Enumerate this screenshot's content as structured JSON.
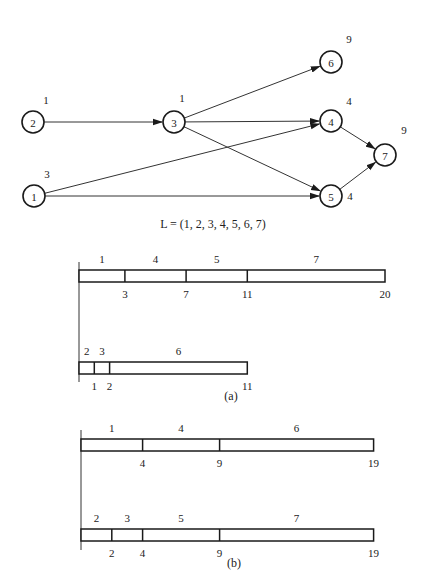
{
  "graph": {
    "nodes": [
      {
        "id": "1",
        "label": "1",
        "weight": "3",
        "x": 34,
        "y": 196,
        "wx": 47,
        "wy": 174
      },
      {
        "id": "2",
        "label": "2",
        "weight": "1",
        "x": 33,
        "y": 122,
        "wx": 46,
        "wy": 100
      },
      {
        "id": "3",
        "label": "3",
        "weight": "1",
        "x": 174,
        "y": 122,
        "wx": 182,
        "wy": 98
      },
      {
        "id": "4",
        "label": "4",
        "weight": "4",
        "x": 331,
        "y": 121,
        "wx": 349,
        "wy": 101
      },
      {
        "id": "5",
        "label": "5",
        "weight": "4",
        "x": 331,
        "y": 196,
        "wx": 350,
        "wy": 196
      },
      {
        "id": "6",
        "label": "6",
        "weight": "9",
        "x": 331,
        "y": 62,
        "wx": 349,
        "wy": 39
      },
      {
        "id": "7",
        "label": "7",
        "weight": "9",
        "x": 385,
        "y": 155,
        "wx": 404,
        "wy": 130
      }
    ],
    "edges": [
      {
        "from": "2",
        "to": "3"
      },
      {
        "from": "3",
        "to": "6"
      },
      {
        "from": "3",
        "to": "4"
      },
      {
        "from": "3",
        "to": "5"
      },
      {
        "from": "1",
        "to": "4"
      },
      {
        "from": "1",
        "to": "5"
      },
      {
        "from": "4",
        "to": "7"
      },
      {
        "from": "5",
        "to": "7"
      }
    ],
    "list_caption": "L = (1, 2, 3, 4, 5, 6, 7)"
  },
  "schedules": {
    "a": {
      "caption": "(a)",
      "processors": [
        {
          "tasks": [
            "1",
            "4",
            "5",
            "7"
          ],
          "boundaries": [
            "3",
            "7",
            "11",
            "20"
          ],
          "starts": [
            0,
            3,
            7,
            11
          ],
          "ends": [
            3,
            7,
            11,
            20
          ]
        },
        {
          "tasks": [
            "2",
            "3",
            "6"
          ],
          "boundaries": [
            "1",
            "2",
            "11"
          ],
          "starts": [
            0,
            1,
            2
          ],
          "ends": [
            1,
            2,
            11
          ]
        }
      ]
    },
    "b": {
      "caption": "(b)",
      "processors": [
        {
          "tasks": [
            "1",
            "4",
            "6"
          ],
          "boundaries": [
            "4",
            "9",
            "19"
          ],
          "starts": [
            0,
            4,
            9
          ],
          "ends": [
            4,
            9,
            19
          ]
        },
        {
          "tasks": [
            "2",
            "3",
            "5",
            "7"
          ],
          "boundaries": [
            "2",
            "4",
            "9",
            "19"
          ],
          "starts": [
            0,
            2,
            4,
            9
          ],
          "ends": [
            2,
            4,
            9,
            19
          ]
        }
      ]
    }
  },
  "colors": {
    "stroke": "#1a1a1a",
    "text": "#222222",
    "background": "#ffffff"
  }
}
